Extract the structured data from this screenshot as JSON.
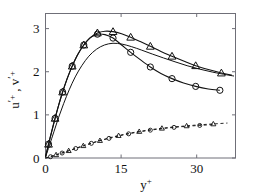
{
  "chart_data": {
    "type": "line",
    "title": "",
    "subtitle": "",
    "xlabel": "y+",
    "ylabel": "u'+ , v'+",
    "xlabel_base": "y",
    "xlabel_sup": "+",
    "ylabel_parts": [
      "u",
      "'",
      "+",
      " , ",
      "v",
      "'",
      "+"
    ],
    "xlim": [
      0,
      37.7
    ],
    "ylim": [
      0,
      3.35
    ],
    "xticks": [
      0,
      15,
      30
    ],
    "xticklabels": [
      "0",
      "15",
      "30"
    ],
    "yticks": [
      0,
      1,
      2,
      3
    ],
    "yticklabels": [
      "0",
      "1",
      "2",
      "3"
    ],
    "grid": false,
    "legend": "none",
    "legend_position": "none",
    "axis_color": "#6f6f78",
    "curve_color": "#121212",
    "series": [
      {
        "name": "u'+ triangles",
        "marker": "triangle",
        "linestyle": "solid",
        "x": [
          0.0,
          0.6,
          1.2,
          1.9,
          2.6,
          3.4,
          4.3,
          5.3,
          6.4,
          7.6,
          8.9,
          10.3,
          11.8,
          13.4,
          15.1,
          16.9,
          18.8,
          20.8,
          22.9,
          25.1,
          27.4,
          29.8,
          32.3,
          34.9,
          37.0
        ],
        "y": [
          0.02,
          0.32,
          0.6,
          0.92,
          1.22,
          1.53,
          1.84,
          2.13,
          2.4,
          2.62,
          2.79,
          2.9,
          2.94,
          2.93,
          2.88,
          2.8,
          2.7,
          2.59,
          2.47,
          2.36,
          2.25,
          2.14,
          2.05,
          1.97,
          1.92
        ],
        "marker_x": [
          0.6,
          1.9,
          3.4,
          5.3,
          7.6,
          10.3,
          13.4,
          16.9,
          20.8,
          25.1,
          29.8,
          34.9
        ],
        "marker_y": [
          0.32,
          0.92,
          1.53,
          2.13,
          2.62,
          2.9,
          2.93,
          2.8,
          2.59,
          2.36,
          2.14,
          1.97
        ]
      },
      {
        "name": "u'+ circles",
        "marker": "circle",
        "linestyle": "solid",
        "x": [
          0.0,
          0.6,
          1.2,
          1.9,
          2.6,
          3.4,
          4.3,
          5.3,
          6.4,
          7.6,
          8.9,
          10.3,
          11.8,
          13.4,
          15.1,
          16.9,
          18.8,
          20.8,
          22.9,
          25.1,
          27.4,
          29.8,
          32.3,
          34.6
        ],
        "y": [
          0.02,
          0.32,
          0.6,
          0.92,
          1.22,
          1.53,
          1.84,
          2.13,
          2.4,
          2.62,
          2.79,
          2.87,
          2.86,
          2.78,
          2.62,
          2.45,
          2.28,
          2.11,
          1.96,
          1.84,
          1.74,
          1.66,
          1.6,
          1.57
        ],
        "marker_x": [
          0.6,
          1.9,
          3.4,
          5.3,
          7.6,
          10.3,
          13.4,
          16.9,
          20.8,
          25.1,
          29.8,
          34.6
        ],
        "marker_y": [
          0.32,
          0.92,
          1.53,
          2.13,
          2.62,
          2.87,
          2.78,
          2.45,
          2.11,
          1.84,
          1.66,
          1.57
        ]
      },
      {
        "name": "u'+ plain line",
        "marker": "none",
        "linestyle": "solid",
        "x": [
          0.0,
          0.8,
          1.7,
          2.6,
          3.6,
          4.7,
          5.9,
          7.2,
          8.6,
          10.1,
          11.7,
          13.4,
          15.2,
          17.1,
          19.1,
          21.2,
          23.4,
          25.7,
          28.1,
          30.6,
          33.2,
          35.9,
          37.4
        ],
        "y": [
          0.02,
          0.3,
          0.62,
          0.94,
          1.26,
          1.58,
          1.88,
          2.14,
          2.36,
          2.52,
          2.62,
          2.66,
          2.64,
          2.58,
          2.5,
          2.41,
          2.32,
          2.23,
          2.14,
          2.06,
          1.99,
          1.93,
          1.9
        ]
      },
      {
        "name": "v'+ triangles",
        "marker": "triangle",
        "linestyle": "dashed",
        "x": [
          0.0,
          1.0,
          2.1,
          3.3,
          4.6,
          6.0,
          7.5,
          9.1,
          10.8,
          12.6,
          14.5,
          16.5,
          18.6,
          20.8,
          23.1,
          25.5,
          28.0,
          30.6,
          33.3,
          36.1
        ],
        "y": [
          0.0,
          0.035,
          0.075,
          0.12,
          0.17,
          0.225,
          0.285,
          0.345,
          0.405,
          0.465,
          0.52,
          0.57,
          0.615,
          0.655,
          0.69,
          0.72,
          0.745,
          0.77,
          0.79,
          0.81
        ],
        "marker_x": [
          2.1,
          4.6,
          7.5,
          10.8,
          14.5,
          18.6,
          23.1,
          28.0,
          33.3
        ],
        "marker_y": [
          0.075,
          0.17,
          0.285,
          0.405,
          0.52,
          0.615,
          0.69,
          0.745,
          0.79
        ]
      },
      {
        "name": "v'+ circles",
        "marker": "circle",
        "linestyle": "dashed",
        "x": [
          0.0,
          1.0,
          2.1,
          3.3,
          4.6,
          6.0,
          7.5,
          9.1,
          10.8,
          12.6,
          14.5,
          16.5,
          18.6,
          20.8,
          23.1,
          25.5,
          28.0,
          30.6,
          33.3
        ],
        "y": [
          0.0,
          0.03,
          0.07,
          0.115,
          0.165,
          0.22,
          0.28,
          0.34,
          0.4,
          0.455,
          0.51,
          0.56,
          0.605,
          0.645,
          0.68,
          0.71,
          0.735,
          0.755,
          0.775
        ],
        "marker_x": [
          1.0,
          3.3,
          6.0,
          9.1,
          12.6,
          16.5,
          20.8,
          25.5,
          30.6
        ],
        "marker_y": [
          0.03,
          0.115,
          0.22,
          0.34,
          0.455,
          0.56,
          0.645,
          0.71,
          0.755
        ]
      }
    ]
  }
}
